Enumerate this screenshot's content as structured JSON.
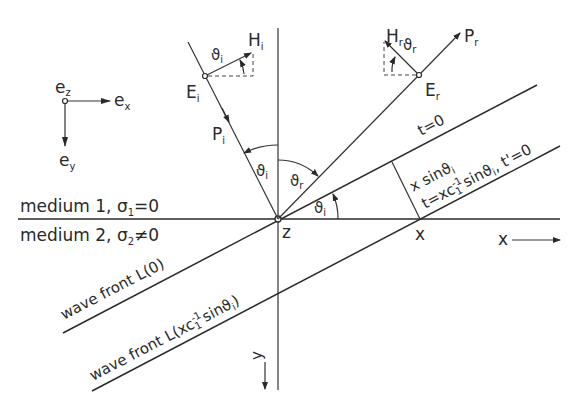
{
  "diagram": {
    "basis": {
      "ez": "e",
      "ez_sub": "z",
      "ex": "e",
      "ex_sub": "x",
      "ey": "e",
      "ey_sub": "y"
    },
    "incident": {
      "E": "E",
      "E_sub": "i",
      "H": "H",
      "H_sub": "i",
      "P": "P",
      "P_sub": "i",
      "angle": "ϑ",
      "angle_sub": "i"
    },
    "reflected": {
      "E": "E",
      "E_sub": "r",
      "H": "H",
      "H_sub": "r",
      "P": "P",
      "P_sub": "r",
      "angle": "ϑ",
      "angle_sub": "r"
    },
    "angles": {
      "theta_i_top": "ϑ",
      "theta_i_top_sub": "i",
      "theta_r_top": "ϑ",
      "theta_r_top_sub": "r",
      "theta_i_axis": "ϑ",
      "theta_i_axis_sub": "i"
    },
    "media": {
      "medium1": "medium 1, σ",
      "medium1_sub": "1",
      "medium1_rest": "=0",
      "medium2": "medium 2, σ",
      "medium2_sub": "2",
      "medium2_rest": "≠0"
    },
    "wavefronts": {
      "L0": "wave front  L(0)",
      "Lx_prefix": "wave front  L(xc",
      "Lx_sup": "-1",
      "Lx_sub": "1",
      "Lx_suffix": " sinϑ",
      "Lx_suffix_sub": "i",
      "Lx_close": ")"
    },
    "annotations": {
      "t0": "t=0",
      "xsin": "x sinϑ",
      "xsin_sub": "i",
      "t_eq_prefix": "t=xc",
      "t_eq_sup": "-1",
      "t_eq_sub": "1",
      "t_eq_mid": " sinϑ",
      "t_eq_mid_sub": "i",
      "t_eq_tail": ",  t'=0"
    },
    "points": {
      "origin": "z",
      "x_point": "x"
    },
    "axes": {
      "x_axis": "x",
      "y_axis": "y"
    }
  }
}
